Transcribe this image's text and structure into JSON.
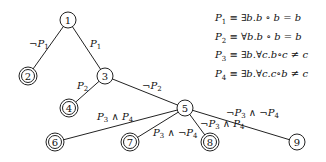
{
  "diagram": {
    "type": "decision-tree",
    "nodes": [
      {
        "id": "1",
        "label": "1",
        "x": 68,
        "y": 20,
        "terminal": false
      },
      {
        "id": "2",
        "label": "2",
        "x": 28,
        "y": 76,
        "terminal": true
      },
      {
        "id": "3",
        "label": "3",
        "x": 105,
        "y": 76,
        "terminal": false
      },
      {
        "id": "4",
        "label": "4",
        "x": 69,
        "y": 108,
        "terminal": true
      },
      {
        "id": "5",
        "label": "5",
        "x": 185,
        "y": 108,
        "terminal": false
      },
      {
        "id": "6",
        "label": "6",
        "x": 55,
        "y": 142,
        "terminal": true
      },
      {
        "id": "7",
        "label": "7",
        "x": 130,
        "y": 142,
        "terminal": true
      },
      {
        "id": "8",
        "label": "8",
        "x": 210,
        "y": 142,
        "terminal": true
      },
      {
        "id": "9",
        "label": "9",
        "x": 297,
        "y": 142,
        "terminal": false
      }
    ],
    "edges": [
      {
        "from": "1",
        "to": "2",
        "label": "¬P1",
        "neg1": "¬",
        "p1": "P",
        "s1": "1"
      },
      {
        "from": "1",
        "to": "3",
        "label": "P1",
        "p1": "P",
        "s1": "1"
      },
      {
        "from": "3",
        "to": "4",
        "label": "P2",
        "p1": "P",
        "s1": "2"
      },
      {
        "from": "3",
        "to": "5",
        "label": "¬P2",
        "neg1": "¬",
        "p1": "P",
        "s1": "2"
      },
      {
        "from": "5",
        "to": "6",
        "label": "P3 ∧ P4"
      },
      {
        "from": "5",
        "to": "7",
        "label": "P3 ∧ ¬P4"
      },
      {
        "from": "5",
        "to": "8",
        "label": "¬P3 ∧ P4"
      },
      {
        "from": "5",
        "to": "9",
        "label": "¬P3 ∧ ¬P4"
      }
    ],
    "legend": [
      {
        "name": "P",
        "sub": "1",
        "definition": " ≡ ∃b.b ∘ b = b"
      },
      {
        "name": "P",
        "sub": "2",
        "definition": " ≡ ∀b.b ∘ b = b"
      },
      {
        "name": "P",
        "sub": "3",
        "definition": " ≡ ∃b.∀c.b∘c ≠ c"
      },
      {
        "name": "P",
        "sub": "4",
        "definition": " ≡ ∃b.∀c.c∘b ≠ c"
      }
    ]
  }
}
